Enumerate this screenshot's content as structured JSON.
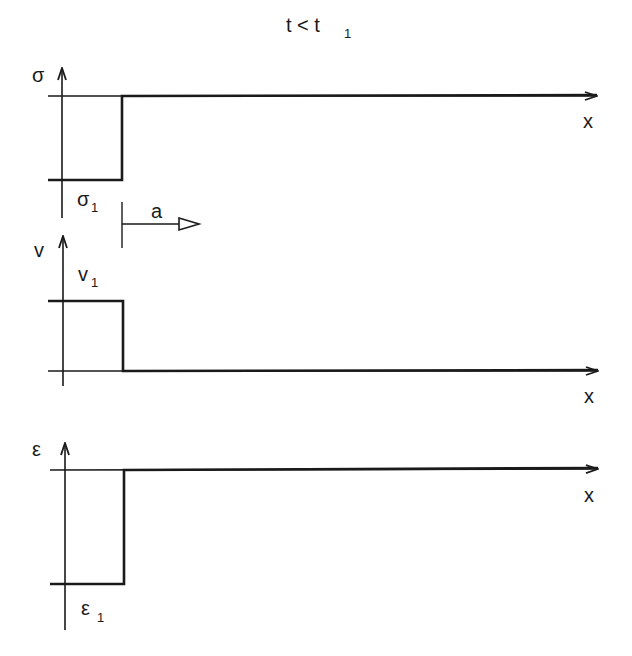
{
  "title": {
    "main": "t < t",
    "sub": "1"
  },
  "panels": [
    {
      "id": "stress",
      "y_label": "σ",
      "x_label": "x",
      "level_label": {
        "main": "σ",
        "sub": "1"
      },
      "description": "Stress is σ1 (negative level) behind the front, zero ahead"
    },
    {
      "id": "velocity",
      "y_label": "v",
      "x_label": "x",
      "level_label": {
        "main": "v",
        "sub": "1"
      },
      "description": "Velocity is v1 behind the front, zero ahead"
    },
    {
      "id": "strain",
      "y_label": "ε",
      "x_label": "x",
      "level_label": {
        "main": "ε",
        "sub": "1"
      },
      "description": "Strain is ε1 (negative level) behind the front, zero ahead"
    }
  ],
  "front": {
    "label": "a",
    "direction": "right"
  },
  "colors": {
    "line": "#1a1a1a",
    "background": "#ffffff"
  }
}
